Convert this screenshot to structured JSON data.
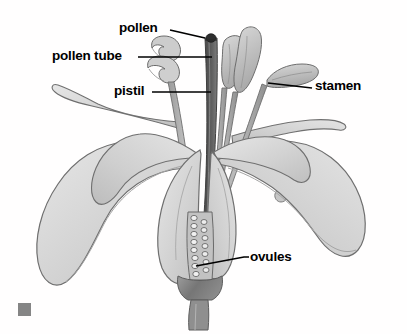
{
  "diagram": {
    "style": "grayscale botanical illustration",
    "background_color": "#fffefe",
    "labels": [
      {
        "id": "pollen",
        "text": "pollen",
        "text_x": 119,
        "text_y": 21,
        "leader": "M 170 30 L 205 38",
        "target": "dark pollen grain at top of style",
        "target_x": 211,
        "target_y": 38
      },
      {
        "id": "pollen-tube",
        "text": "pollen tube",
        "text_x": 52,
        "text_y": 49,
        "leader": "M 138 57 L 212 57",
        "target": "tube descending from stigma into style",
        "target_x": 212,
        "target_y": 57
      },
      {
        "id": "pistil",
        "text": "pistil",
        "text_x": 114,
        "text_y": 84,
        "leader": "M 152 92 L 211 92",
        "target": "central style column",
        "target_x": 211,
        "target_y": 92
      },
      {
        "id": "stamen",
        "text": "stamen",
        "text_x": 315,
        "text_y": 79,
        "leader": "M 268 83 L 312 88",
        "target": "right-hand anther and filament",
        "target_x": 268,
        "target_y": 83
      },
      {
        "id": "ovules",
        "text": "ovules",
        "text_x": 250,
        "text_y": 250,
        "leader": "M 196 266 L 244 257 L 249 257",
        "target": "ovules inside the ovary",
        "target_x": 196,
        "target_y": 266
      }
    ],
    "marker": {
      "name": "corner-square-marker",
      "color": "#858585",
      "x": 18,
      "y": 303,
      "width": 13,
      "height": 13
    },
    "colors": {
      "petal_fill": "#d4d4d4",
      "petal_fill_light": "#e2e2e2",
      "petal_outline": "#6f6f6f",
      "style_dark": "#5a5a5a",
      "anther_fill": "#c9c9c9",
      "receptacle": "#8d8d8d",
      "label_text": "#000000",
      "leader_line": "#000000"
    },
    "parts": [
      "petal",
      "stigma",
      "style",
      "anther",
      "filament",
      "ovary",
      "ovule",
      "receptacle",
      "stem"
    ]
  }
}
